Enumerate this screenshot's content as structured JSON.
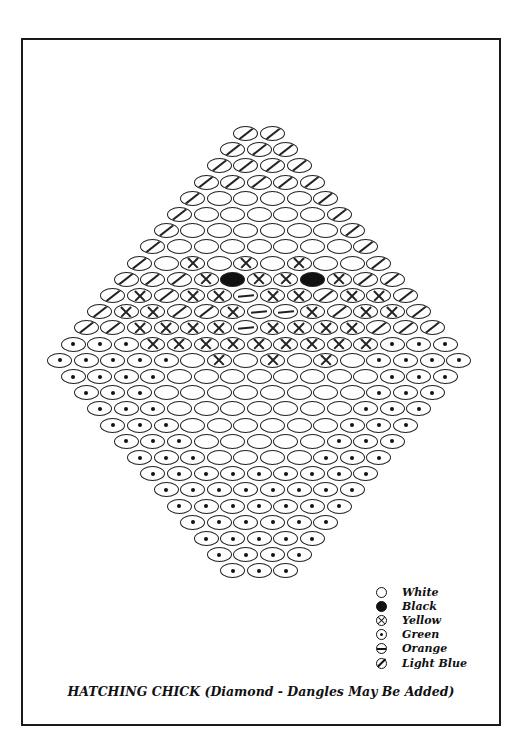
{
  "title": "HATCHING CHICK (Diamond -  Dangles May Be Added)",
  "legend": [
    {
      "code": "W",
      "label": "White",
      "symbol": "empty-circle"
    },
    {
      "code": "B",
      "label": "Black",
      "symbol": "filled-circle"
    },
    {
      "code": "Y",
      "label": "Yellow",
      "symbol": "circled-x"
    },
    {
      "code": "G",
      "label": "Green",
      "symbol": "circled-dot"
    },
    {
      "code": "O",
      "label": "Orange",
      "symbol": "circled-minus"
    },
    {
      "code": "L",
      "label": "Light Blue",
      "symbol": "circled-slash"
    }
  ],
  "pattern": {
    "rows": [
      "LL",
      "LLL",
      "LLLL",
      "LLLLL",
      "LWWWWL",
      "LWWWWWL",
      "LWWWWWWL",
      "LWWWWWWWL",
      "LWYWYWYWWL",
      "LLLYBYYBYLL",
      "LYLYYOYYLYYL",
      "LYYLLYOOYLYYL",
      "LLYYYYOYYYYLLL",
      "GGGYYYYYYYYYGGG",
      "GGGGGWYWYWYWGGGG",
      "GGGGWWWWWWWWGGG",
      "GGGWWWWWWWWGGG",
      "GGGWWWWWWWGGG",
      "GGGWWWWWWGGG",
      "GGGWWWWWGGG",
      "GGGWWWWGGG",
      "GGGGGGGGG",
      "GGGGGGGG",
      "GGGGGGG",
      "GGGGGG",
      "GGGGG",
      "GGGG",
      "GGG"
    ]
  }
}
